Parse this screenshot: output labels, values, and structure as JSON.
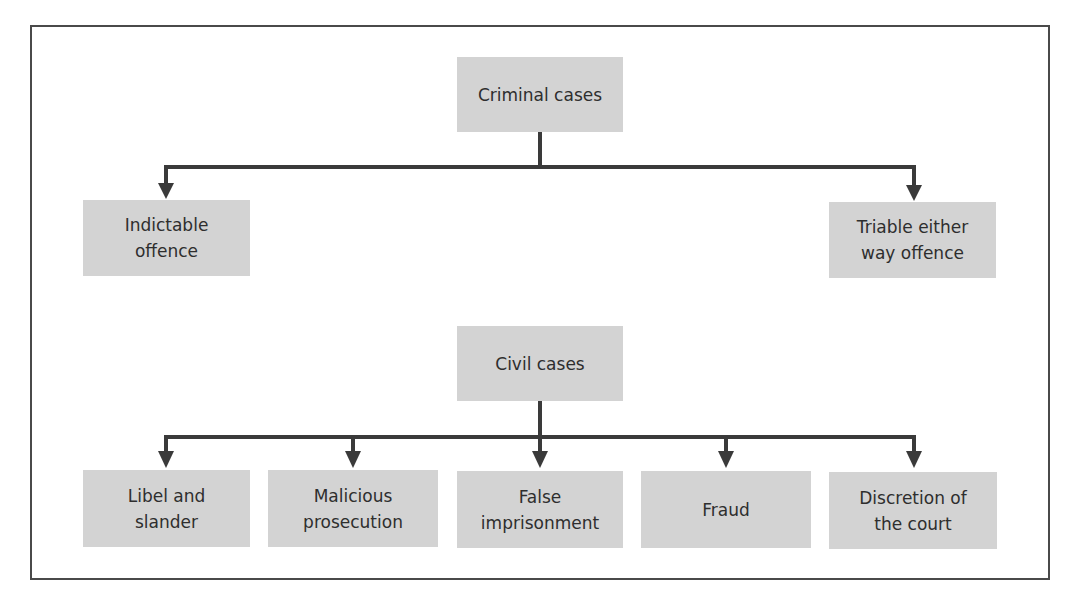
{
  "colors": {
    "box_fill": "#d3d3d3",
    "line": "#3a3a3a",
    "frame": "#4a4a4a",
    "text": "#2e2e2e",
    "background": "#ffffff"
  },
  "criminal": {
    "root": "Criminal cases",
    "children": [
      "Indictable\noffence",
      "Triable either\nway offence"
    ]
  },
  "civil": {
    "root": "Civil cases",
    "children": [
      "Libel and\nslander",
      "Malicious\nprosecution",
      "False\nimprisonment",
      "Fraud",
      "Discretion of\nthe court"
    ]
  }
}
